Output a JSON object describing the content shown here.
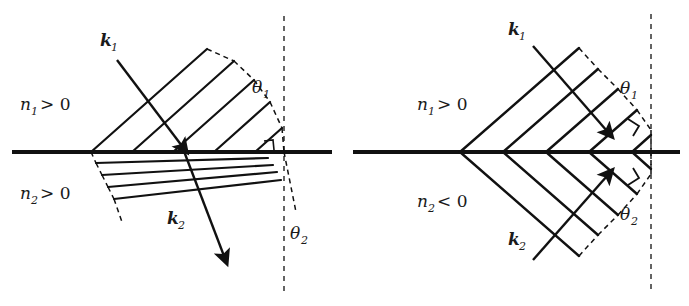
{
  "figure": {
    "kind": "optics-refraction-diagram",
    "background_color": "#ffffff",
    "stroke_color": "#111111",
    "panel_count": 2
  },
  "panels": [
    {
      "id": "left",
      "name": "positive-index-refraction",
      "caption_region": "positive index medium pair",
      "media": {
        "upper": {
          "symbol": "n",
          "subscript": "1",
          "relation": ">",
          "value": "0",
          "text": "n₁ > 0"
        },
        "lower": {
          "symbol": "n",
          "subscript": "2",
          "relation": ">",
          "value": "0",
          "text": "n₂ > 0"
        }
      },
      "wavevectors": {
        "incident": {
          "symbol": "k",
          "subscript": "1",
          "text": "k₁"
        },
        "transmitted": {
          "symbol": "k",
          "subscript": "2",
          "text": "k₂"
        }
      },
      "angles": {
        "incidence": {
          "symbol": "θ",
          "subscript": "1",
          "text": "θ₁"
        },
        "refraction": {
          "symbol": "θ",
          "subscript": "2",
          "text": "θ₂"
        }
      },
      "normal_line": "vertical dashed",
      "interface_line": "horizontal solid thick",
      "transmitted_side": "right-of-normal (ordinary refraction)"
    },
    {
      "id": "right",
      "name": "negative-index-refraction",
      "caption_region": "negative index medium pair",
      "media": {
        "upper": {
          "symbol": "n",
          "subscript": "1",
          "relation": ">",
          "value": "0",
          "text": "n₁ > 0"
        },
        "lower": {
          "symbol": "n",
          "subscript": "2",
          "relation": "<",
          "value": "0",
          "text": "n₂ < 0"
        }
      },
      "wavevectors": {
        "incident": {
          "symbol": "k",
          "subscript": "1",
          "text": "k₁"
        },
        "transmitted": {
          "symbol": "k",
          "subscript": "2",
          "text": "k₂"
        }
      },
      "angles": {
        "incidence": {
          "symbol": "θ",
          "subscript": "1",
          "text": "θ₁"
        },
        "refraction": {
          "symbol": "θ",
          "subscript": "2",
          "text": "θ₂"
        }
      },
      "normal_line": "vertical dashed",
      "interface_line": "horizontal solid thick",
      "transmitted_side": "same-side-as-incident (negative refraction)"
    }
  ],
  "labels": {
    "n1_gt_0": "n",
    "n1_sub": "1",
    "n1_rel": "> 0",
    "n2_gt_0": "n",
    "n2_sub": "2",
    "n2_rel_pos": "> 0",
    "n2_rel_neg": "< 0",
    "k": "k",
    "k1_sub": "1",
    "k2_sub": "2",
    "theta": "θ",
    "theta1_sub": "1",
    "theta2_sub": "2"
  }
}
